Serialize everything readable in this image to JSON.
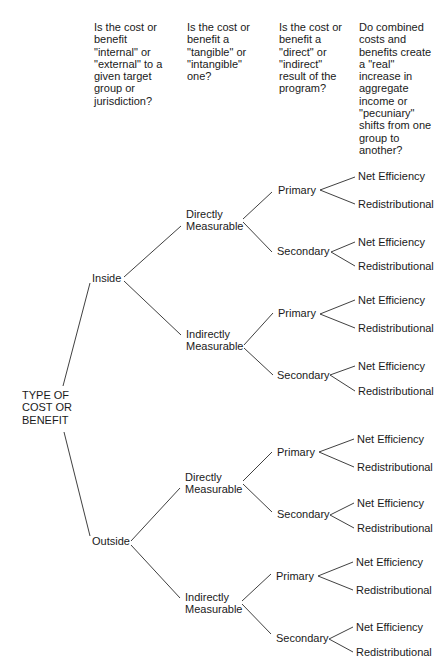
{
  "headers": [
    "Is the cost or\nbenefit\n\"internal\" or\n\"external\" to a\ngiven target\ngroup or\njurisdiction?",
    "Is the cost or\nbenefit a\n\"tangible\" or\n\"intangible\"\none?",
    "Is the cost or\nbenefit a\n\"direct\" or\n\"indirect\"\nresult of the\nprogram?",
    "Do combined\ncosts and\nbenefits create\na \"real\"\nincrease in\naggregate\nincome or\n\"pecuniary\"\nshifts from one\ngroup to\nanother?"
  ],
  "tree": {
    "root": "TYPE OF\nCOST OR\nBENEFIT",
    "level1": [
      "Inside",
      "Outside"
    ],
    "level2": [
      "Directly\nMeasurable",
      "Indirectly\nMeasurable"
    ],
    "level3": [
      "Primary",
      "Secondary"
    ],
    "level4": [
      "Net Efficiency",
      "Redistributional"
    ]
  }
}
